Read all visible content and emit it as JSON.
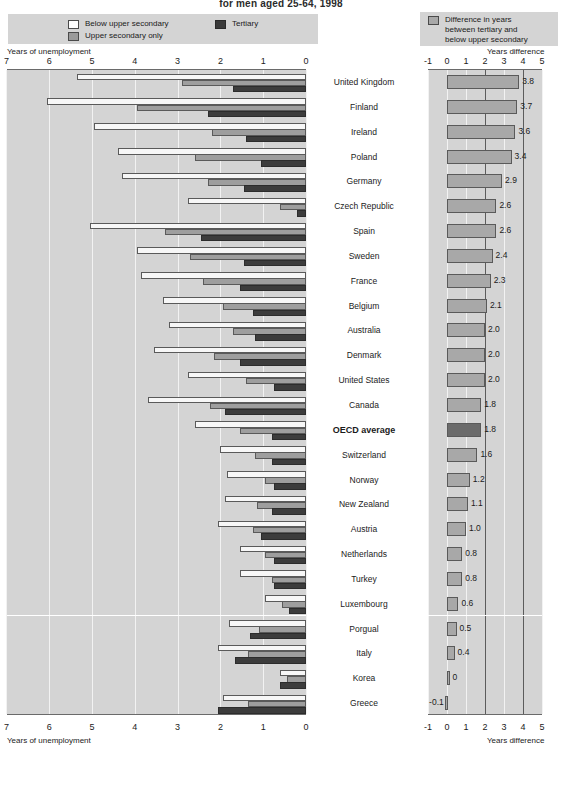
{
  "title": "for men aged 25-64, 1998",
  "legend_left": {
    "items": [
      {
        "label": "Below upper secondary",
        "swatch": "white-swatch",
        "color": "#fdfdfd"
      },
      {
        "label": "Upper secondary only",
        "swatch": "gray-swatch",
        "color": "#9a9a9a"
      },
      {
        "label": "Tertiary",
        "swatch": "dark-swatch",
        "color": "#3a3a3a"
      }
    ]
  },
  "legend_right": {
    "swatch": "gray-swatch",
    "color": "#a8a8a8",
    "lines": [
      "Difference in years",
      "between tertiary and",
      "below upper secondary"
    ]
  },
  "axes": {
    "left_caption": "Years of unemployment",
    "left_ticks": [
      "7",
      "6",
      "5",
      "4",
      "3",
      "2",
      "1",
      "0"
    ],
    "right_caption": "Years difference",
    "right_ticks": [
      "-1",
      "0",
      "1",
      "2",
      "3",
      "4",
      "5"
    ]
  },
  "chart_data": {
    "type": "bar",
    "title": "for men aged 25-64, 1998",
    "xlabel": "Years of unemployment",
    "ylabel": "",
    "orientation": "horizontal",
    "xlim_left": [
      0,
      7
    ],
    "xlim_right": [
      -1,
      5
    ],
    "x_direction_left": "reversed",
    "grid": true,
    "legend_position": "top",
    "categories": [
      "United Kingdom",
      "Finland",
      "Ireland",
      "Poland",
      "Germany",
      "Czech Republic",
      "Spain",
      "Sweden",
      "France",
      "Belgium",
      "Australia",
      "Denmark",
      "United States",
      "Canada",
      "OECD average",
      "Switzerland",
      "Norway",
      "New Zealand",
      "Austria",
      "Netherlands",
      "Turkey",
      "Luxembourg",
      "Porgual",
      "Italy",
      "Korea",
      "Greece"
    ],
    "series": [
      {
        "name": "Below upper secondary",
        "values": [
          5.35,
          6.05,
          4.95,
          4.4,
          4.3,
          2.75,
          5.05,
          3.95,
          3.85,
          3.35,
          3.2,
          3.55,
          2.75,
          3.7,
          2.6,
          2.0,
          1.85,
          1.9,
          2.05,
          1.55,
          1.55,
          0.95,
          1.8,
          2.05,
          0.6,
          1.95
        ]
      },
      {
        "name": "Upper secondary only",
        "values": [
          2.9,
          3.95,
          2.2,
          2.6,
          2.3,
          0.6,
          3.3,
          2.7,
          2.4,
          1.95,
          1.7,
          2.15,
          1.4,
          2.25,
          1.55,
          1.2,
          0.95,
          1.15,
          1.25,
          0.95,
          0.8,
          0.55,
          1.1,
          1.35,
          0.45,
          1.35
        ]
      },
      {
        "name": "Tertiary",
        "values": [
          1.7,
          2.3,
          1.4,
          1.05,
          1.45,
          0.2,
          2.45,
          1.45,
          1.55,
          1.25,
          1.2,
          1.55,
          0.75,
          1.9,
          0.8,
          0.8,
          0.75,
          0.8,
          1.05,
          0.75,
          0.75,
          0.4,
          1.3,
          1.65,
          0.6,
          2.05
        ]
      }
    ]
  },
  "difference": {
    "name": "Difference in years between tertiary and below upper secondary",
    "highlight_category": "OECD average",
    "values": [
      {
        "country": "United Kingdom",
        "value": 3.8,
        "label": "3.8"
      },
      {
        "country": "Finland",
        "value": 3.7,
        "label": "3.7"
      },
      {
        "country": "Ireland",
        "value": 3.6,
        "label": "3.6"
      },
      {
        "country": "Poland",
        "value": 3.4,
        "label": "3.4"
      },
      {
        "country": "Germany",
        "value": 2.9,
        "label": "2.9"
      },
      {
        "country": "Czech Republic",
        "value": 2.6,
        "label": "2.6"
      },
      {
        "country": "Spain",
        "value": 2.6,
        "label": "2.6"
      },
      {
        "country": "Sweden",
        "value": 2.4,
        "label": "2.4"
      },
      {
        "country": "France",
        "value": 2.3,
        "label": "2.3"
      },
      {
        "country": "Belgium",
        "value": 2.1,
        "label": "2.1"
      },
      {
        "country": "Australia",
        "value": 2.0,
        "label": "2.0"
      },
      {
        "country": "Denmark",
        "value": 2.0,
        "label": "2.0"
      },
      {
        "country": "United States",
        "value": 2.0,
        "label": "2.0"
      },
      {
        "country": "Canada",
        "value": 1.8,
        "label": "1.8"
      },
      {
        "country": "OECD average",
        "value": 1.8,
        "label": "1.8"
      },
      {
        "country": "Switzerland",
        "value": 1.6,
        "label": "1.6"
      },
      {
        "country": "Norway",
        "value": 1.2,
        "label": "1.2"
      },
      {
        "country": "New Zealand",
        "value": 1.1,
        "label": "1.1"
      },
      {
        "country": "Austria",
        "value": 1.0,
        "label": "1.0"
      },
      {
        "country": "Netherlands",
        "value": 0.8,
        "label": "0.8"
      },
      {
        "country": "Turkey",
        "value": 0.8,
        "label": "0.8"
      },
      {
        "country": "Luxembourg",
        "value": 0.6,
        "label": "0.6"
      },
      {
        "country": "Porgual",
        "value": 0.5,
        "label": "0.5"
      },
      {
        "country": "Italy",
        "value": 0.4,
        "label": "0.4"
      },
      {
        "country": "Korea",
        "value": 0.0,
        "label": "0"
      },
      {
        "country": "Greece",
        "value": -0.1,
        "label": "-0.1"
      }
    ]
  }
}
